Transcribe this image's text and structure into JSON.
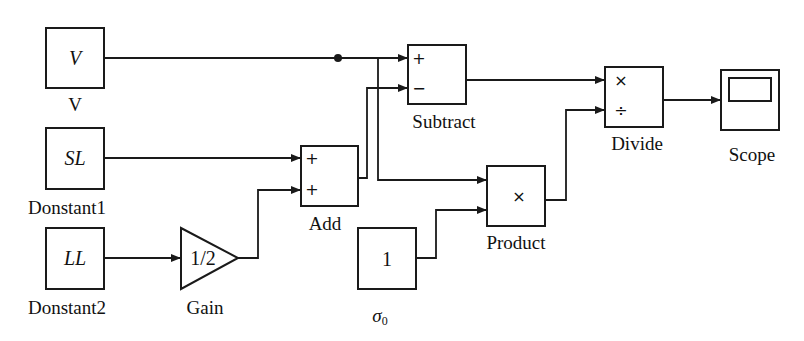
{
  "diagram": {
    "type": "simulink-block-diagram",
    "blocks": {
      "v_const": {
        "content": "V",
        "label": "V"
      },
      "sl_const": {
        "content": "SL",
        "label": "Donstant1"
      },
      "ll_const": {
        "content": "LL",
        "label": "Donstant2"
      },
      "gain": {
        "content": "1/2",
        "label": "Gain"
      },
      "add": {
        "signs": [
          "+",
          "+"
        ],
        "label": "Add"
      },
      "subtract": {
        "signs": [
          "+",
          "−"
        ],
        "label": "Subtract"
      },
      "sigma_const": {
        "content": "1",
        "label": "σ",
        "label_sub": "0"
      },
      "product": {
        "content": "×",
        "label": "Product"
      },
      "divide": {
        "signs": [
          "×",
          "÷"
        ],
        "label": "Divide"
      },
      "scope": {
        "label": "Scope"
      }
    },
    "connections": [
      {
        "from": "V",
        "to": "Subtract.+"
      },
      {
        "from": "V (branch)",
        "to": "Product.in1"
      },
      {
        "from": "Donstant1",
        "to": "Add.+1"
      },
      {
        "from": "Donstant2",
        "to": "Gain"
      },
      {
        "from": "Gain",
        "to": "Add.+2"
      },
      {
        "from": "Add",
        "to": "Subtract.−"
      },
      {
        "from": "σ0",
        "to": "Product.in2"
      },
      {
        "from": "Subtract",
        "to": "Divide.×"
      },
      {
        "from": "Product",
        "to": "Divide.÷"
      },
      {
        "from": "Divide",
        "to": "Scope"
      }
    ]
  }
}
